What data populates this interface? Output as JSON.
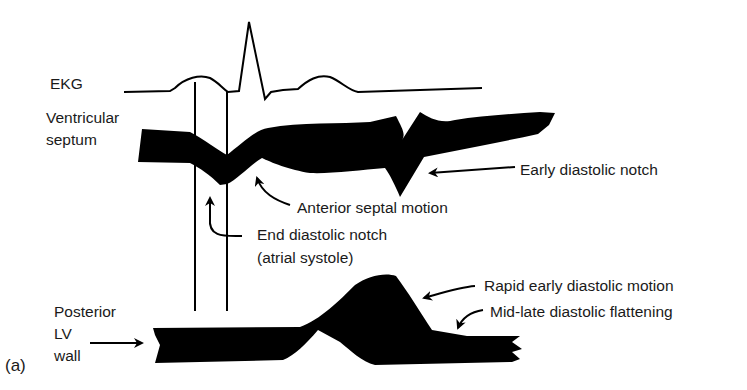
{
  "figure": {
    "panel_label": "(a)",
    "traces": {
      "ekg": "EKG",
      "septum_line1": "Ventricular",
      "septum_line2": "septum",
      "posterior_line1": "Posterior",
      "posterior_line2": "LV",
      "posterior_line3": "wall"
    },
    "annotations": {
      "early_diastolic_notch": "Early diastolic notch",
      "anterior_septal_motion": "Anterior septal motion",
      "end_diastolic_notch_line1": "End diastolic notch",
      "end_diastolic_notch_line2": "(atrial systole)",
      "rapid_early_diastolic_motion": "Rapid early diastolic motion",
      "mid_late_diastolic_flattening": "Mid-late diastolic flattening"
    },
    "colors": {
      "ink": "#000000",
      "background": "#ffffff"
    }
  }
}
